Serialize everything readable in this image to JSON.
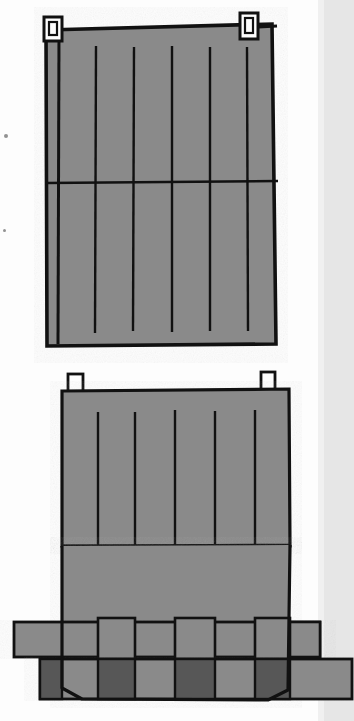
{
  "document": {
    "kind": "patent-line-drawing",
    "title": "Woven panel assembly drawing sheet",
    "sheet_width": 354,
    "sheet_height": 721,
    "background_color": "#fdfdfd",
    "ink_color": "#111111",
    "fill_color": "#8a8a8a",
    "shadow_fill_color": "#575757",
    "scan_band_color": "#e2e2e2"
  },
  "figures": [
    {
      "id": "figure-upper",
      "name": "upper-woven-panel",
      "description": "Rectangular woven panel with six vertical stitch lines, one horizontal cross line and two corner hanging loops",
      "body": {
        "x": 44,
        "y": 27,
        "width": 231,
        "height": 318,
        "fill": "#8a8a8a",
        "stroke": "#111111",
        "stroke_width": 3.4
      },
      "outline_points": "46,30 270,24 275,343 47,345",
      "horizontal_line": {
        "y": 182,
        "x1": 46,
        "x2": 278,
        "stroke_width": 2.2
      },
      "vertical_lines": [
        {
          "x": 59,
          "y1": 33,
          "y2": 343
        },
        {
          "x": 96,
          "y1": 46,
          "y2": 332
        },
        {
          "x": 134,
          "y1": 47,
          "y2": 331
        },
        {
          "x": 172,
          "y1": 46,
          "y2": 332
        },
        {
          "x": 210,
          "y1": 47,
          "y2": 331
        },
        {
          "x": 247,
          "y1": 47,
          "y2": 331
        }
      ],
      "tabs": [
        {
          "name": "hanging-loop-left",
          "x": 44,
          "y": 18,
          "width": 17,
          "height": 23
        },
        {
          "name": "hanging-loop-right",
          "x": 240,
          "y": 14,
          "width": 17,
          "height": 24
        }
      ]
    },
    {
      "id": "figure-lower",
      "name": "lower-woven-panel-with-straps",
      "description": "Same panel shown with lower region separated into vertical slats interlaced with two horizontal straps",
      "body": {
        "x": 62,
        "y": 390,
        "width": 228,
        "height": 230,
        "fill": "#8a8a8a",
        "stroke": "#111111",
        "stroke_width": 3.2
      },
      "horizontal_line": {
        "y": 545,
        "x1": 64,
        "x2": 288,
        "stroke_width": 2.2
      },
      "vertical_lines": [
        {
          "x": 98,
          "y1": 410,
          "y2": 690
        },
        {
          "x": 134,
          "y1": 410,
          "y2": 690
        },
        {
          "x": 174,
          "y1": 410,
          "y2": 690
        },
        {
          "x": 215,
          "y1": 410,
          "y2": 690
        },
        {
          "x": 254,
          "y1": 410,
          "y2": 690
        }
      ],
      "tabs": [
        {
          "name": "hanging-loop-left",
          "x": 68,
          "y": 375,
          "width": 14,
          "height": 18
        },
        {
          "name": "hanging-loop-right",
          "x": 262,
          "y": 373,
          "width": 13,
          "height": 19
        }
      ],
      "slats": [
        {
          "name": "slat-1",
          "x": 62,
          "y": 545,
          "width": 36,
          "height": 115
        },
        {
          "name": "slat-2",
          "x": 98,
          "y": 545,
          "width": 36,
          "height": 145
        },
        {
          "name": "slat-3",
          "x": 134,
          "y": 545,
          "width": 40,
          "height": 115
        },
        {
          "name": "slat-4",
          "x": 174,
          "y": 545,
          "width": 41,
          "height": 145
        },
        {
          "name": "slat-5",
          "x": 215,
          "y": 545,
          "width": 39,
          "height": 115
        },
        {
          "name": "slat-6",
          "x": 254,
          "y": 545,
          "width": 36,
          "height": 145
        }
      ],
      "straps": [
        {
          "name": "strap-upper",
          "x": 14,
          "y": 622,
          "width": 306,
          "height": 35,
          "fill": "#8a8a8a",
          "over_segments": [
            {
              "x": 14,
              "y": 622,
              "width": 84,
              "height": 35
            },
            {
              "x": 134,
              "y": 622,
              "width": 40,
              "height": 35
            },
            {
              "x": 215,
              "y": 622,
              "width": 39,
              "height": 35
            },
            {
              "x": 290,
              "y": 622,
              "width": 30,
              "height": 35
            }
          ]
        },
        {
          "name": "strap-lower",
          "x": 40,
          "y": 659,
          "width": 310,
          "height": 40,
          "fill": "#8a8a8a",
          "shadow_segments": [
            {
              "x": 40,
              "y": 659,
              "width": 22,
              "height": 40
            },
            {
              "x": 98,
              "y": 659,
              "width": 36,
              "height": 40
            },
            {
              "x": 174,
              "y": 659,
              "width": 41,
              "height": 40
            },
            {
              "x": 254,
              "y": 659,
              "width": 36,
              "height": 40
            }
          ]
        }
      ]
    }
  ],
  "scan_artifacts": {
    "right_band": {
      "x": 322,
      "y": 0,
      "width": 32,
      "height": 721,
      "color": "#e2e2e2"
    },
    "specks": [
      {
        "x": 4,
        "y": 134,
        "size": 4
      },
      {
        "x": 3,
        "y": 229,
        "size": 3
      }
    ]
  }
}
